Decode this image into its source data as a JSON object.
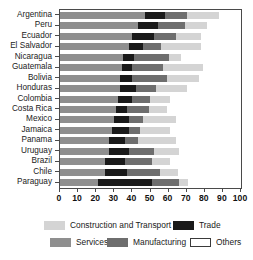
{
  "chart_data": {
    "type": "bar",
    "orientation": "horizontal",
    "stacked": true,
    "title": "",
    "xlabel": "",
    "ylabel": "",
    "xlim": [
      0,
      100
    ],
    "xticks": [
      0,
      10,
      20,
      30,
      40,
      50,
      60,
      70,
      80,
      90,
      100
    ],
    "xtick_labels": [
      "0",
      "10",
      "20",
      "30",
      "40",
      "50",
      "60",
      "70",
      "80",
      "90",
      "100"
    ],
    "grid": false,
    "legend_position": "bottom",
    "categories": [
      "Argentina",
      "Peru",
      "Ecuador",
      "El Salvador",
      "Nicaragua",
      "Guatemala",
      "Bolivia",
      "Honduras",
      "Colombia",
      "Costa Rica",
      "Mexico",
      "Jamaica",
      "Panama",
      "Uruguay",
      "Brazil",
      "Chile",
      "Paraguay"
    ],
    "series": [
      {
        "name": "Services",
        "color": "#8f8f8f",
        "values": [
          47,
          43,
          40,
          38,
          35,
          34,
          33,
          33,
          32,
          31,
          30,
          29,
          27,
          27,
          25,
          25,
          21
        ]
      },
      {
        "name": "Trade",
        "color": "#1a1a1a",
        "values": [
          11,
          11,
          12,
          8,
          6,
          6,
          7,
          9,
          8,
          6,
          8,
          9,
          9,
          11,
          11,
          12,
          30
        ]
      },
      {
        "name": "Manufacturing",
        "color": "#6e6e6e",
        "values": [
          12,
          15,
          12,
          10,
          19,
          17,
          19,
          11,
          10,
          12,
          8,
          6,
          7,
          14,
          15,
          18,
          15
        ]
      },
      {
        "name": "Construction and Transport",
        "color": "#d4d4d4",
        "values": [
          18,
          12,
          14,
          22,
          7,
          22,
          18,
          17,
          11,
          10,
          18,
          17,
          21,
          14,
          10,
          10,
          5
        ]
      },
      {
        "name": "Others",
        "color": "#ffffff",
        "values": [
          12,
          19,
          22,
          22,
          33,
          21,
          23,
          30,
          39,
          41,
          36,
          39,
          36,
          34,
          39,
          35,
          29
        ]
      }
    ]
  },
  "legend": {
    "entries": [
      {
        "label": "Construction and Transport",
        "swatch_class": "seg-construction"
      },
      {
        "label": "Trade",
        "swatch_class": "seg-trade"
      },
      {
        "label": "Services",
        "swatch_class": "seg-services"
      },
      {
        "label": "Manufacturing",
        "swatch_class": "seg-manufacturing"
      },
      {
        "label": "Others",
        "swatch_class": "seg-others"
      }
    ]
  }
}
